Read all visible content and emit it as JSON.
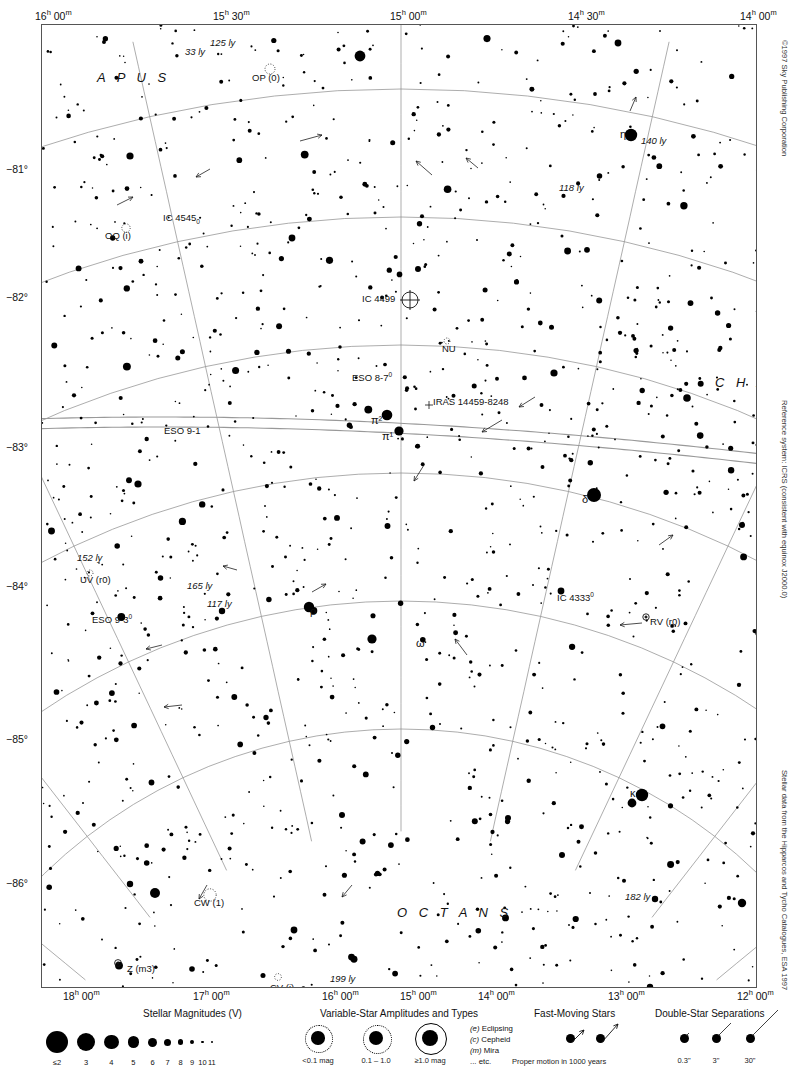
{
  "chart_data": {
    "type": "scatter",
    "projection": "conic",
    "xlabel": "Right Ascension",
    "ylabel": "Declination",
    "grid": true,
    "ra_top_ticks": [
      "16h 00m",
      "15h 30m",
      "15h 00m",
      "14h 30m",
      "14h 00m"
    ],
    "ra_bottom_ticks": [
      "18h 00m",
      "17h 00m",
      "16h 00m",
      "15h 00m",
      "14h 00m",
      "13h 00m",
      "12h 00m"
    ],
    "dec_ticks": [
      "-81°",
      "-82°",
      "-83°",
      "-84°",
      "-85°",
      "-86°"
    ],
    "dec_range": [
      -86.5,
      -80.5
    ],
    "constellations": [
      "APUS",
      "CHA",
      "OCTANS"
    ],
    "annotations": [
      {
        "label": "125 ly",
        "kind": "distance"
      },
      {
        "label": "33 ly",
        "kind": "distance"
      },
      {
        "label": "140 ly",
        "kind": "distance"
      },
      {
        "label": "118 ly",
        "kind": "distance"
      },
      {
        "label": "152 ly",
        "kind": "distance"
      },
      {
        "label": "165 ly",
        "kind": "distance"
      },
      {
        "label": "117 ly",
        "kind": "distance"
      },
      {
        "label": "182 ly",
        "kind": "distance"
      },
      {
        "label": "199 ly",
        "kind": "distance"
      },
      {
        "label": "162 ly",
        "kind": "distance"
      },
      {
        "label": "120 ly",
        "kind": "distance"
      },
      {
        "label": "OP (0)",
        "kind": "variable-star"
      },
      {
        "label": "OQ (i)",
        "kind": "variable-star"
      },
      {
        "label": "NU",
        "kind": "variable-star"
      },
      {
        "label": "UV (r0)",
        "kind": "variable-star"
      },
      {
        "label": "RV (r0)",
        "kind": "variable-star"
      },
      {
        "label": "U (m3)",
        "kind": "variable-star"
      },
      {
        "label": "CW (1)",
        "kind": "variable-star"
      },
      {
        "label": "CV (i)",
        "kind": "variable-star"
      },
      {
        "label": "Z (m3)",
        "kind": "variable-star"
      },
      {
        "label": "IC 4545",
        "kind": "deep-sky"
      },
      {
        "label": "IC 4499",
        "kind": "globular-cluster"
      },
      {
        "label": "IC 4333",
        "kind": "deep-sky"
      },
      {
        "label": "ESO 8-7",
        "kind": "deep-sky"
      },
      {
        "label": "ESO 9-1",
        "kind": "deep-sky"
      },
      {
        "label": "ESO 9-3",
        "kind": "deep-sky"
      },
      {
        "label": "IRAS 14459-8248",
        "kind": "infrared-source"
      },
      {
        "label": "η",
        "kind": "bayer-star"
      },
      {
        "label": "δ",
        "kind": "bayer-star"
      },
      {
        "label": "π¹",
        "kind": "bayer-star"
      },
      {
        "label": "π²",
        "kind": "bayer-star"
      },
      {
        "label": "ρ",
        "kind": "bayer-star"
      },
      {
        "label": "ω",
        "kind": "bayer-star"
      },
      {
        "label": "κ",
        "kind": "bayer-star"
      },
      {
        "label": "ι",
        "kind": "bayer-star"
      }
    ],
    "magnitude_scale": [
      "≤2",
      "3",
      "4",
      "5",
      "6",
      "7",
      "8",
      "9",
      "10",
      "11"
    ],
    "magnitude_dot_px": [
      22,
      18,
      14.5,
      11.5,
      9,
      7,
      5.2,
      3.8,
      2.8,
      2.2
    ]
  },
  "top_axis": {
    "ticks": [
      {
        "label_html": "16<sup>h</sup> 00<sup>m</sup>",
        "x": 35
      },
      {
        "label_html": "15<sup>h</sup> 30<sup>m</sup>",
        "x": 213
      },
      {
        "label_html": "15<sup>h</sup> 00<sup>m</sup>",
        "x": 390
      },
      {
        "label_html": "14<sup>h</sup> 30<sup>m</sup>",
        "x": 568
      },
      {
        "label_html": "14<sup>h</sup> 00<sup>m</sup>",
        "x": 740
      }
    ]
  },
  "bottom_axis": {
    "ticks": [
      {
        "label_html": "18<sup>h</sup> 00<sup>m</sup>",
        "x": 63
      },
      {
        "label_html": "17<sup>h</sup> 00<sup>m</sup>",
        "x": 193
      },
      {
        "label_html": "16<sup>h</sup> 00<sup>m</sup>",
        "x": 322
      },
      {
        "label_html": "15<sup>h</sup> 00<sup>m</sup>",
        "x": 400
      },
      {
        "label_html": "14<sup>h</sup> 00<sup>m</sup>",
        "x": 478
      },
      {
        "label_html": "13<sup>h</sup> 00<sup>m</sup>",
        "x": 608
      },
      {
        "label_html": "12<sup>h</sup> 00<sup>m</sup>",
        "x": 737
      }
    ]
  },
  "dec_axis": {
    "ticks": [
      {
        "label": "−81°",
        "y": 170
      },
      {
        "label": "−82°",
        "y": 298
      },
      {
        "label": "−83°",
        "y": 448
      },
      {
        "label": "−84°",
        "y": 587
      },
      {
        "label": "−85°",
        "y": 740
      },
      {
        "label": "−86°",
        "y": 884
      }
    ]
  },
  "constellation_labels": [
    {
      "name": "APUS",
      "text": "A P U S",
      "x": 55,
      "y": 45
    },
    {
      "name": "CHA",
      "text": "C H A",
      "x": 673,
      "y": 350
    },
    {
      "name": "OCTANS",
      "text": "O C T A N S",
      "x": 355,
      "y": 880
    }
  ],
  "object_labels": [
    {
      "name": "dist-125ly",
      "text": "125 ly",
      "x": 168,
      "y": 12,
      "italic": true
    },
    {
      "name": "dist-33ly",
      "text": "33 ly",
      "x": 143,
      "y": 21,
      "italic": true
    },
    {
      "name": "var-OP",
      "text": "OP (0)",
      "x": 210,
      "y": 47,
      "italic": false
    },
    {
      "name": "var-OQ",
      "text": "OQ (i)",
      "x": 63,
      "y": 205,
      "italic": false
    },
    {
      "name": "ic-4545",
      "text": "IC 4545",
      "x": 121,
      "y": 187,
      "italic": false,
      "sub": "0"
    },
    {
      "name": "eta-star",
      "text": "η",
      "x": 578,
      "y": 103,
      "greek": true
    },
    {
      "name": "dist-140ly",
      "text": "140 ly",
      "x": 599,
      "y": 110,
      "italic": true
    },
    {
      "name": "dist-118ly",
      "text": "118 ly",
      "x": 517,
      "y": 157,
      "italic": true
    },
    {
      "name": "ic-4499",
      "text": "IC 4499",
      "x": 320,
      "y": 268,
      "italic": false
    },
    {
      "name": "var-NU",
      "text": "NU",
      "x": 400,
      "y": 318,
      "italic": false
    },
    {
      "name": "eso-8-7",
      "text": "ESO 8-7",
      "x": 310,
      "y": 346,
      "italic": false,
      "sup": "0"
    },
    {
      "name": "iras-source",
      "text": "IRAS 14459-8248",
      "x": 391,
      "y": 371,
      "italic": false
    },
    {
      "name": "pi2-star",
      "text": "π²",
      "x": 329,
      "y": 389,
      "greek": true
    },
    {
      "name": "pi1-star",
      "text": "π¹",
      "x": 340,
      "y": 405,
      "greek": true
    },
    {
      "name": "eso-9-1",
      "text": "ESO 9-1",
      "x": 122,
      "y": 400,
      "italic": false
    },
    {
      "name": "delta-star",
      "text": "δ",
      "x": 540,
      "y": 468,
      "greek": true
    },
    {
      "name": "dist-152ly",
      "text": "152 ly",
      "x": 35,
      "y": 527,
      "italic": true
    },
    {
      "name": "var-UV",
      "text": "UV (r0)",
      "x": 38,
      "y": 549,
      "italic": false
    },
    {
      "name": "eso-9-3",
      "text": "ESO 9-3",
      "x": 50,
      "y": 588,
      "italic": false,
      "sup": "0"
    },
    {
      "name": "dist-165ly",
      "text": "165 ly",
      "x": 145,
      "y": 555,
      "italic": true
    },
    {
      "name": "dist-117ly",
      "text": "117 ly",
      "x": 165,
      "y": 573,
      "italic": true
    },
    {
      "name": "rho-star",
      "text": "ρ",
      "x": 268,
      "y": 580,
      "greek": true
    },
    {
      "name": "omega-star",
      "text": "ω",
      "x": 374,
      "y": 612,
      "greek": true
    },
    {
      "name": "ic-4333",
      "text": "IC 4333",
      "x": 515,
      "y": 566,
      "italic": false,
      "sup": "0"
    },
    {
      "name": "var-RV",
      "text": "RV (r0)",
      "x": 608,
      "y": 591,
      "italic": false
    },
    {
      "name": "var-U",
      "text": "U (m3)",
      "x": 724,
      "y": 610,
      "italic": false
    },
    {
      "name": "kappa-star",
      "text": "κ",
      "x": 588,
      "y": 762,
      "greek": true
    },
    {
      "name": "iota-star",
      "text": "ι",
      "x": 756,
      "y": 748,
      "greek": true
    },
    {
      "name": "var-CW",
      "text": "CW (1)",
      "x": 152,
      "y": 872,
      "italic": false
    },
    {
      "name": "var-Z",
      "text": "Z (m3)",
      "x": 85,
      "y": 938,
      "italic": false
    },
    {
      "name": "var-CV",
      "text": "CV (i)",
      "x": 228,
      "y": 957,
      "italic": false
    },
    {
      "name": "dist-162ly",
      "text": "162 ly",
      "x": 182,
      "y": 981,
      "italic": true
    },
    {
      "name": "dist-199ly",
      "text": "199 ly",
      "x": 288,
      "y": 948,
      "italic": true
    },
    {
      "name": "dist-182ly",
      "text": "182 ly",
      "x": 583,
      "y": 866,
      "italic": true
    },
    {
      "name": "dist-120ly",
      "text": "120 ly",
      "x": 520,
      "y": 978,
      "italic": true
    }
  ],
  "side_credits": {
    "copyright": "©1997 Sky Publishing Corporation",
    "reference_system": "Reference system: ICRS (consistent with equinox J2000.0)",
    "data_source": "Stellar data from the Hipparcos and Tycho Catalogues, ESA 1997"
  },
  "legend": {
    "page_number": "1027",
    "sheet_ref": "1031",
    "magnitudes": {
      "title": "Stellar Magnitudes (V)",
      "labels": [
        "≤2",
        "3",
        "4",
        "5",
        "6",
        "7",
        "8",
        "9",
        "10",
        "11"
      ]
    },
    "variables": {
      "title": "Variable-Star Amplitudes and Types",
      "amplitude_labels": [
        "<0.1 mag",
        "0.1 – 1.0",
        "≥1.0 mag"
      ],
      "types": [
        {
          "code": "(e)",
          "name": "Eclipsing"
        },
        {
          "code": "(c)",
          "name": "Cepheid"
        },
        {
          "code": "(m)",
          "name": "Mira"
        },
        {
          "code": "",
          "name": "... etc."
        }
      ]
    },
    "fast_moving": {
      "title": "Fast-Moving Stars",
      "caption": "Proper motion in 1000 years"
    },
    "double_stars": {
      "title": "Double-Star Separations",
      "labels": [
        "0.3\"",
        "3\"",
        "30\""
      ]
    }
  },
  "colors": {
    "ink": "#111111",
    "grid": "#8a8a8a",
    "frame": "#555555",
    "ecliptic": "#7a7a7a"
  }
}
